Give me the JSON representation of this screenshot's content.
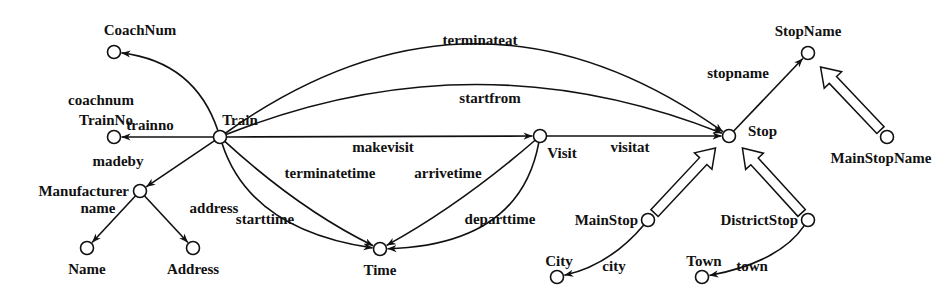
{
  "diagram": {
    "type": "schema-graph",
    "nodes": [
      {
        "id": "Train",
        "label": "Train"
      },
      {
        "id": "CoachNum",
        "label": "CoachNum"
      },
      {
        "id": "TrainNo",
        "label": "TrainNo"
      },
      {
        "id": "Manufacturer",
        "label": "Manufacturer"
      },
      {
        "id": "Name",
        "label": "Name"
      },
      {
        "id": "Address",
        "label": "Address"
      },
      {
        "id": "Time",
        "label": "Time"
      },
      {
        "id": "Visit",
        "label": "Visit"
      },
      {
        "id": "Stop",
        "label": "Stop"
      },
      {
        "id": "StopName",
        "label": "StopName"
      },
      {
        "id": "MainStopName",
        "label": "MainStopName"
      },
      {
        "id": "MainStop",
        "label": "MainStop"
      },
      {
        "id": "DistrictStop",
        "label": "DistrictStop"
      },
      {
        "id": "City",
        "label": "City"
      },
      {
        "id": "Town",
        "label": "Town"
      }
    ],
    "edges": [
      {
        "from": "Train",
        "to": "CoachNum",
        "label": "coachnum"
      },
      {
        "from": "Train",
        "to": "TrainNo",
        "label": "trainno"
      },
      {
        "from": "Train",
        "to": "Manufacturer",
        "label": "madeby"
      },
      {
        "from": "Manufacturer",
        "to": "Name",
        "label": "name"
      },
      {
        "from": "Manufacturer",
        "to": "Address",
        "label": "address"
      },
      {
        "from": "Train",
        "to": "Stop",
        "label": "terminateat"
      },
      {
        "from": "Train",
        "to": "Stop",
        "label": "startfrom"
      },
      {
        "from": "Train",
        "to": "Visit",
        "label": "makevisit"
      },
      {
        "from": "Visit",
        "to": "Stop",
        "label": "visitat"
      },
      {
        "from": "Train",
        "to": "Time",
        "label": "terminatetime"
      },
      {
        "from": "Train",
        "to": "Time",
        "label": "starttime"
      },
      {
        "from": "Visit",
        "to": "Time",
        "label": "arrivetime"
      },
      {
        "from": "Visit",
        "to": "Time",
        "label": "departtime"
      },
      {
        "from": "Stop",
        "to": "StopName",
        "label": "stopname"
      },
      {
        "from": "MainStop",
        "to": "City",
        "label": "city"
      },
      {
        "from": "DistrictStop",
        "to": "Town",
        "label": "town"
      }
    ],
    "isa": [
      {
        "sub": "MainStopName",
        "super": "StopName"
      },
      {
        "sub": "MainStop",
        "super": "Stop"
      },
      {
        "sub": "DistrictStop",
        "super": "Stop"
      }
    ]
  }
}
